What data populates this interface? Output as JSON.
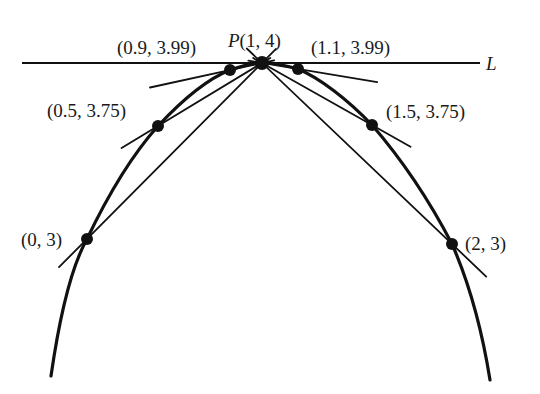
{
  "figure": {
    "point_P": {
      "label": "P(1, 4)",
      "label_prefix": "P",
      "label_coords": "(1, 4)",
      "x": 1,
      "y": 4
    },
    "tangent_line": {
      "label": "L",
      "slope": 0
    },
    "curve": {
      "equation": "y = 4 - (x - 1)^2"
    },
    "points": [
      {
        "label": "(0, 3)",
        "x": 0,
        "y": 3,
        "side": "left"
      },
      {
        "label": "(0.5, 3.75)",
        "x": 0.5,
        "y": 3.75,
        "side": "left"
      },
      {
        "label": "(0.9, 3.99)",
        "x": 0.9,
        "y": 3.99,
        "side": "left"
      },
      {
        "label": "(1.1, 3.99)",
        "x": 1.1,
        "y": 3.99,
        "side": "right"
      },
      {
        "label": "(1.5, 3.75)",
        "x": 1.5,
        "y": 3.75,
        "side": "right"
      },
      {
        "label": "(2, 3)",
        "x": 2,
        "y": 3,
        "side": "right"
      }
    ]
  }
}
